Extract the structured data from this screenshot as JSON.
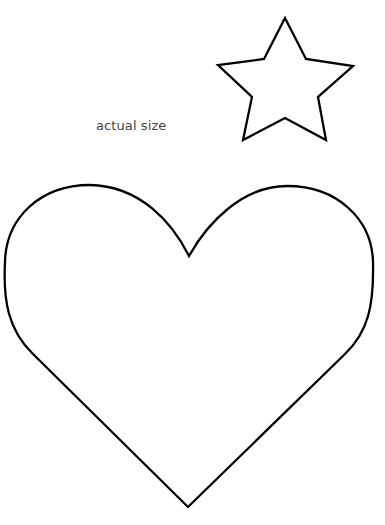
{
  "label": {
    "text": "actual size"
  },
  "shapes": {
    "star": {
      "stroke": "#000000",
      "fill": "#ffffff"
    },
    "heart": {
      "stroke": "#000000",
      "fill": "#ffffff"
    }
  }
}
